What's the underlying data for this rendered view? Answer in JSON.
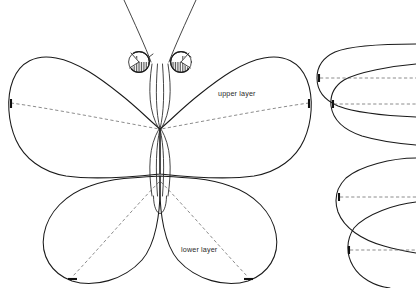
{
  "canvas": {
    "width": 416,
    "height": 288,
    "background": "#ffffff",
    "title": "butterfly-pattern-template"
  },
  "style": {
    "line_color": "#1a1a1a",
    "dashed_color": "#6e6e6e",
    "text_color": "#2a2a2a",
    "hatch_color": "#2b2b2b"
  },
  "labels": {
    "upper_layer": "upper layer",
    "lower_layer": "lower layer"
  },
  "label_positions": {
    "upper_layer": {
      "x": 218,
      "y": 96
    },
    "lower_layer": {
      "x": 181,
      "y": 252
    }
  },
  "figure": {
    "name": "butterfly-template",
    "parts": [
      {
        "name": "left-upper-wing",
        "label": "upper layer"
      },
      {
        "name": "right-upper-wing",
        "label": "upper layer"
      },
      {
        "name": "left-lower-wing",
        "label": "lower layer"
      },
      {
        "name": "right-lower-wing",
        "label": "lower layer"
      },
      {
        "name": "body",
        "label": ""
      },
      {
        "name": "left-antenna",
        "label": ""
      },
      {
        "name": "right-antenna",
        "label": ""
      },
      {
        "name": "left-eye",
        "label": ""
      },
      {
        "name": "right-eye",
        "label": ""
      }
    ]
  },
  "side_pieces": [
    {
      "name": "side-piece-top",
      "label": ""
    },
    {
      "name": "side-piece-middle",
      "label": ""
    },
    {
      "name": "side-piece-bottom-upper",
      "label": ""
    },
    {
      "name": "side-piece-bottom-lower",
      "label": ""
    }
  ],
  "paths": {
    "left_upper_wing": "M 160,129 C 150,121 138,108 120,94 C 100,78 78,62 56,58 C 36,54 20,62 13,80 C 6,98 8,122 16,140 C 24,158 42,172 66,176 C 94,180 132,177 160,174 Z",
    "right_upper_wing": "M 160,129 C 170,121 182,108 200,94 C 220,78 242,62 264,58 C 284,54 300,62 307,80 C 314,98 312,122 304,140 C 296,158 278,172 254,176 C 226,180 188,177 160,174 Z",
    "left_lower_wing": "M 160,176 C 140,177 112,178 90,186 C 66,194 48,212 44,234 C 40,256 52,274 72,281 C 94,288 124,280 142,260 C 156,244 160,212 160,190 Z",
    "right_lower_wing": "M 160,176 C 180,177 208,178 230,186 C 254,194 272,212 276,234 C 280,256 268,274 248,281 C 226,288 196,280 178,260 C 164,244 160,212 160,190 Z",
    "body_left": "M 153,63 C 149,90 150,112 159,129 C 150,146 149,168 153,196",
    "body_right": "M 167,63 C 171,90 170,112 161,129 C 170,146 171,168 167,196",
    "body_inner_left": "M 158,64 C 156,92 156,112 160,129 C 156,146 156,168 158,196",
    "body_inner_right": "M 162,64 C 164,92 164,112 160,129 C 164,146 164,168 162,196",
    "abdomen_tip": "M 154,196 C 154,207 157,213 160,213 C 163,213 166,207 166,196",
    "left_antenna": "M 151,62 C 146,48 134,22 124,0",
    "right_antenna": "M 169,62 C 174,48 186,22 196,0",
    "upper_wing_dash_left": "M 11,103 C 48,108 110,120 159,129",
    "upper_wing_dash_right": "M 309,103 C 272,108 210,120 161,129",
    "lower_wing_dash_left": "M 159,182 C 130,212 96,252 72,277",
    "lower_wing_dash_right": "M 161,182 C 190,212 224,252 248,277",
    "side_top": "M 416,44 C 390,44 352,45 335,52 C 322,58 317,68 317,78 C 317,90 324,100 338,106 C 356,113 392,116 416,117",
    "side_top_dash": "M 320,78 L 416,78",
    "side_middle": "M 416,64 C 392,66 358,72 344,80 C 333,87 330,96 331,106 C 333,120 344,130 362,136 C 382,142 404,144 416,145",
    "side_middle_dash": "M 334,104 L 416,104",
    "side_lower_a": "M 416,158 C 392,158 360,166 346,178 C 336,188 334,200 338,212 C 344,228 362,240 384,246 C 398,250 410,252 416,253",
    "side_lower_a_dash": "M 340,197 L 416,197",
    "side_lower_b": "M 416,202 C 396,204 366,214 354,228 C 346,240 346,254 353,266 C 360,278 374,286 390,288",
    "side_lower_b_dash": "M 350,250 L 416,250"
  },
  "ticks": [
    {
      "name": "tick-left-wing",
      "x": 11,
      "y": 103
    },
    {
      "name": "tick-right-wing",
      "x": 309,
      "y": 103
    },
    {
      "name": "tick-left-lower",
      "x": 72,
      "y": 277
    },
    {
      "name": "tick-right-lower",
      "x": 248,
      "y": 277
    },
    {
      "name": "tick-side-top",
      "x": 320,
      "y": 78
    },
    {
      "name": "tick-side-middle",
      "x": 334,
      "y": 104
    },
    {
      "name": "tick-side-lower-a",
      "x": 340,
      "y": 197
    },
    {
      "name": "tick-side-lower-b",
      "x": 350,
      "y": 250
    }
  ],
  "eyes": {
    "left": {
      "cx": 139,
      "cy": 62,
      "r": 11
    },
    "right": {
      "cx": 181,
      "cy": 62,
      "r": 11
    },
    "hatch_spacing": 1.6
  }
}
